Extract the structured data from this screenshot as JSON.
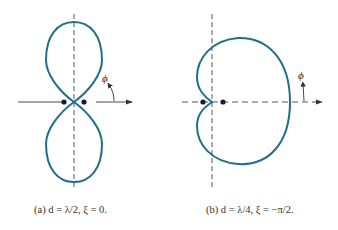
{
  "figure": {
    "colors": {
      "pattern": "#1f6f8b",
      "axis": "#333333",
      "element": "#1a1a2e"
    },
    "panels": [
      {
        "id": "a",
        "caption": "(a) d = λ/2, ξ = 0.",
        "angle_label": "ϕ",
        "pattern_shape": "figure-eight (broadside, two lobes along vertical axis)"
      },
      {
        "id": "b",
        "caption": "(b) d = λ/4, ξ = −π/2.",
        "angle_label": "ϕ",
        "pattern_shape": "cardioid (endfire, main lobe toward +x)"
      }
    ]
  }
}
